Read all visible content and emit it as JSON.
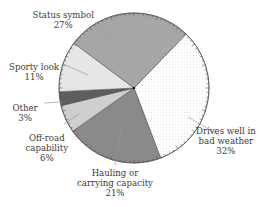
{
  "chart_data": {
    "type": "pie",
    "title": "",
    "categories": [
      "Drives well in bad weather",
      "Hauling or carrying capacity",
      "Off-road capability",
      "Other",
      "Sporty look",
      "Status symbol"
    ],
    "values": [
      32,
      21,
      6,
      3,
      11,
      27
    ],
    "unit": "%",
    "start_angle_deg": -46,
    "direction": "clockwise",
    "center": [
      134,
      88
    ],
    "radius": 75,
    "slices": [
      {
        "label_lines": [
          "Drives well in",
          "bad weather"
        ],
        "pct": "32%",
        "value": 32,
        "color": "#ffffff",
        "label_pos": [
          226,
          126
        ],
        "leader": [
          [
            188,
            117
          ],
          [
            220,
            136
          ]
        ]
      },
      {
        "label_lines": [
          "Hauling or",
          "carrying capacity"
        ],
        "pct": "21%",
        "value": 21,
        "color": "#8a8a8a",
        "label_pos": [
          115,
          168
        ],
        "leader": [
          [
            122,
            128
          ],
          [
            115,
            165
          ]
        ]
      },
      {
        "label_lines": [
          "Off-road",
          "capability"
        ],
        "pct": "6%",
        "value": 6,
        "color": "#cfcfcf",
        "label_pos": [
          47,
          133
        ],
        "leader": [
          [
            79,
            114
          ],
          [
            64,
            124
          ]
        ]
      },
      {
        "label_lines": [
          "Other"
        ],
        "pct": "3%",
        "value": 3,
        "color": "#5e5e5e",
        "label_pos": [
          25,
          103
        ],
        "leader": [
          [
            44,
            103
          ],
          [
            62,
            102
          ]
        ]
      },
      {
        "label_lines": [
          "Sporty look"
        ],
        "pct": "11%",
        "value": 11,
        "color": "#e6e6e6",
        "label_pos": [
          34,
          62
        ],
        "leader": [
          [
            63,
            64
          ],
          [
            88,
            75
          ]
        ]
      },
      {
        "label_lines": [
          "Status symbol"
        ],
        "pct": "27%",
        "value": 27,
        "color": "#a6a6a6",
        "label_pos": [
          63,
          10
        ],
        "leader": [
          [
            95,
            22
          ],
          [
            118,
            43
          ]
        ]
      }
    ]
  }
}
